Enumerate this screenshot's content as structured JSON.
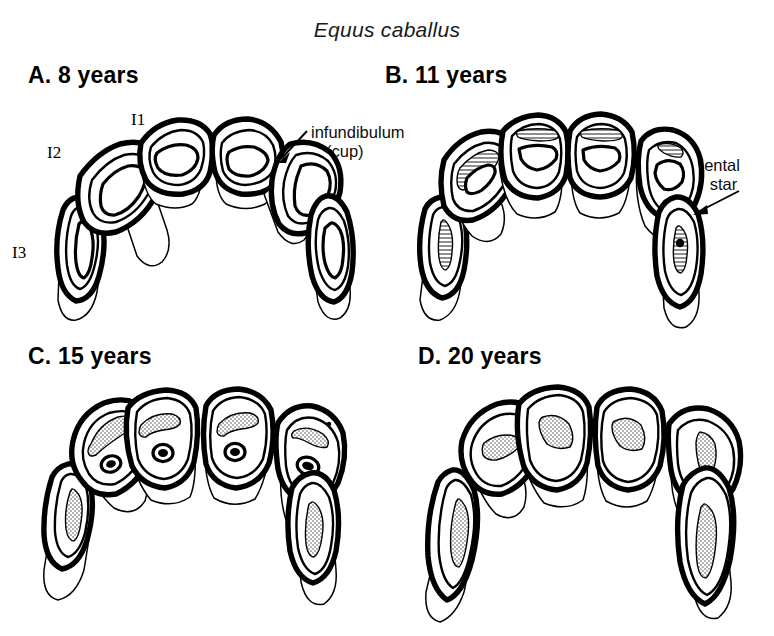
{
  "figure": {
    "species_title": "Equus caballus",
    "background_color": "#ffffff",
    "ink_color": "#000000"
  },
  "panels": [
    {
      "key": "a",
      "label": "A. 8 years",
      "age_years": 8,
      "tooth_ids": [
        {
          "name": "I1",
          "label": "I1"
        },
        {
          "name": "I2",
          "label": "I2"
        },
        {
          "name": "I3",
          "label": "I3"
        }
      ],
      "callout": {
        "name": "infundibulum-callout",
        "line1": "infundibulum",
        "line2": "(cup)"
      },
      "occlusal_shape": "oval / transversely elongate",
      "cup_present": true,
      "dental_star_present": false,
      "tooth_count": 6
    },
    {
      "key": "b",
      "label": "B. 11 years",
      "age_years": 11,
      "callout": {
        "name": "dental-star-callout",
        "line1": "dental",
        "line2": "star"
      },
      "occlusal_shape": "rounded to oval, cups shrinking",
      "cup_present": true,
      "dental_star_present": true,
      "tooth_count": 6
    },
    {
      "key": "c",
      "label": "C. 15 years",
      "age_years": 15,
      "occlusal_shape": "triangular, cup reduced to small ring",
      "cup_present": true,
      "dental_star_present": true,
      "tooth_count": 6
    },
    {
      "key": "d",
      "label": "D. 20 years",
      "age_years": 20,
      "occlusal_shape": "triangular to longitudinally oval, cup gone",
      "cup_present": false,
      "dental_star_present": true,
      "tooth_count": 6
    }
  ]
}
